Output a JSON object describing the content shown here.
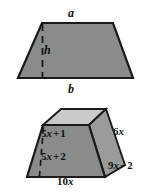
{
  "figure": {
    "colors": {
      "face_gray": "#8a8c8c",
      "top_face_gray": "#c9cacа",
      "side_face_gray": "#9a9c9c",
      "outline": "#1a1a1a",
      "background": "#ffffff"
    },
    "top_figure": {
      "name": "trapezoid",
      "labels": {
        "top_side": "a",
        "height": "h",
        "bottom_side": "b"
      }
    },
    "bottom_figure": {
      "name": "trapezoidal-prism",
      "labels": {
        "front_upper": {
          "coefficient": "5",
          "variable": "x",
          "operator": "+",
          "constant": "1",
          "full": "5x + 1"
        },
        "front_lower": {
          "coefficient": "5",
          "variable": "x",
          "operator": "+",
          "constant": "2",
          "full": "5x + 2"
        },
        "right_upper": {
          "coefficient": "6",
          "variable": "x",
          "full": "6x"
        },
        "right_lower": {
          "coefficient": "9",
          "variable": "x",
          "operator": "−",
          "constant": "2",
          "full": "9x − 2"
        },
        "bottom": {
          "coefficient": "10",
          "variable": "x",
          "full": "10x"
        }
      }
    }
  }
}
